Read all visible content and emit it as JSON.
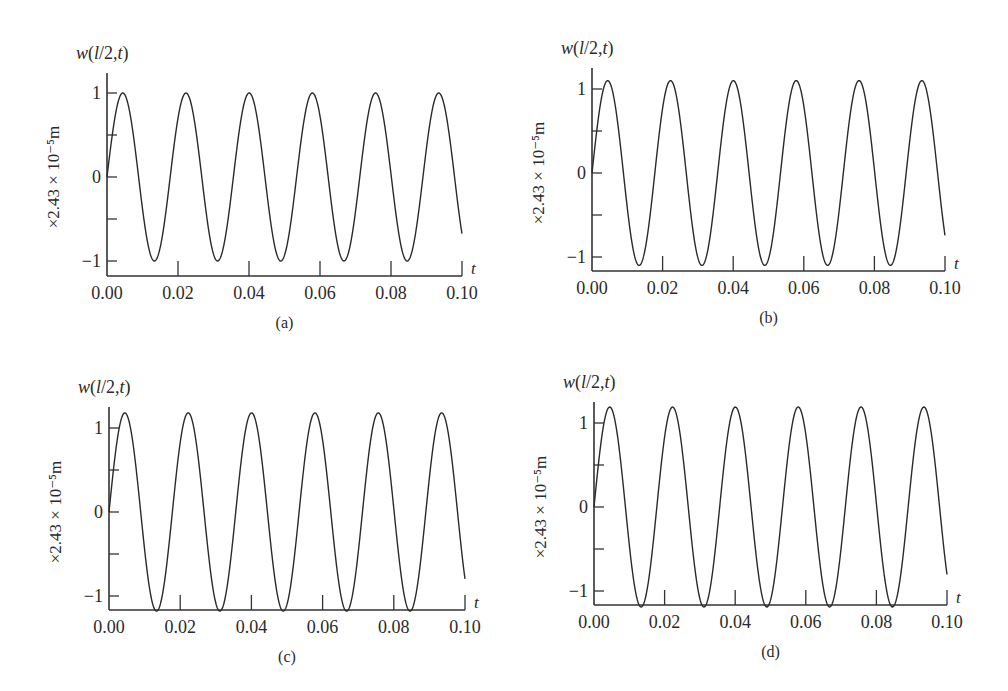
{
  "figure": {
    "background": "#ffffff",
    "line_color": "#2a2a2a",
    "axis_color": "#333333"
  },
  "chart_data": [
    {
      "type": "line",
      "panel_label": "(a)",
      "ylabel_top": "w(l/2,t)",
      "ylabel_side": "×2.43 × 10⁻⁵m",
      "xlabel": "t",
      "xticks": [
        "0.00",
        "0.02",
        "0.04",
        "0.06",
        "0.08",
        "0.10"
      ],
      "yticks": [
        "−1",
        "0",
        "1"
      ],
      "xlim": [
        0,
        0.1
      ],
      "ylim": [
        -1,
        1
      ],
      "amplitude": 1.0,
      "period": 0.0175,
      "peaks_t": [
        0.0045,
        0.022,
        0.0395,
        0.057,
        0.0745,
        0.092
      ],
      "series": [
        {
          "name": "w(l/2,t)",
          "description": "sinusoidal oscillation, amplitude ≈ 1.0, starts at 0, ends ≈ −0.5 at t=0.10"
        }
      ],
      "layout": {
        "x0": 107,
        "x1": 462,
        "yzero": 177,
        "yunit": 84,
        "axis_y": 276,
        "axis_top": 73
      }
    },
    {
      "type": "line",
      "panel_label": "(b)",
      "ylabel_top": "w(l/2,t)",
      "ylabel_side": "×2.43 × 10⁻⁵m",
      "xlabel": "t",
      "xticks": [
        "0.00",
        "0.02",
        "0.04",
        "0.06",
        "0.08",
        "0.10"
      ],
      "yticks": [
        "−1",
        "0",
        "1"
      ],
      "xlim": [
        0,
        0.1
      ],
      "ylim": [
        -1.1,
        1.1
      ],
      "amplitude": 1.1,
      "period": 0.0175,
      "peaks_t": [
        0.0045,
        0.022,
        0.0395,
        0.057,
        0.0745,
        0.092
      ],
      "series": [
        {
          "name": "w(l/2,t)",
          "description": "sinusoidal oscillation, amplitude ≈ 1.1"
        }
      ],
      "layout": {
        "x0": 592,
        "x1": 945,
        "yzero": 173,
        "yunit": 84,
        "axis_y": 271,
        "axis_top": 68
      }
    },
    {
      "type": "line",
      "panel_label": "(c)",
      "ylabel_top": "w(l/2,t)",
      "ylabel_side": "×2.43 × 10⁻⁵m",
      "xlabel": "t",
      "xticks": [
        "0.00",
        "0.02",
        "0.04",
        "0.06",
        "0.08",
        "0.10"
      ],
      "yticks": [
        "−1",
        "0",
        "1"
      ],
      "xlim": [
        0,
        0.1
      ],
      "ylim": [
        -1.18,
        1.18
      ],
      "amplitude": 1.18,
      "period": 0.0175,
      "peaks_t": [
        0.0045,
        0.022,
        0.0395,
        0.057,
        0.0745,
        0.092
      ],
      "series": [
        {
          "name": "w(l/2,t)",
          "description": "sinusoidal oscillation, amplitude ≈ 1.18, troughs touch x-axis"
        }
      ],
      "layout": {
        "x0": 109,
        "x1": 465,
        "yzero": 512,
        "yunit": 84,
        "axis_y": 610,
        "axis_top": 407
      }
    },
    {
      "type": "line",
      "panel_label": "(d)",
      "ylabel_top": "w(l/2,t)",
      "ylabel_side": "×2.43 × 10⁻⁵m",
      "xlabel": "t",
      "xticks": [
        "0.00",
        "0.02",
        "0.04",
        "0.06",
        "0.08",
        "0.10"
      ],
      "yticks": [
        "−1",
        "0",
        "1"
      ],
      "xlim": [
        0,
        0.1
      ],
      "ylim": [
        -1.19,
        1.19
      ],
      "amplitude": 1.19,
      "period": 0.0175,
      "peaks_t": [
        0.0045,
        0.022,
        0.0395,
        0.057,
        0.0745,
        0.092
      ],
      "series": [
        {
          "name": "w(l/2,t)",
          "description": "sinusoidal oscillation, amplitude ≈ 1.19, troughs touch x-axis"
        }
      ],
      "layout": {
        "x0": 594,
        "x1": 947,
        "yzero": 507,
        "yunit": 84,
        "axis_y": 605,
        "axis_top": 402
      }
    }
  ]
}
